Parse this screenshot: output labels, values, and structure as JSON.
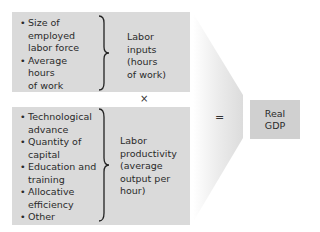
{
  "diagram": {
    "top_box": {
      "items": [
        "Size of employed labor force",
        "Average hours of work"
      ],
      "items_display": [
        [
          "Size of",
          "employed",
          "labor force"
        ],
        [
          "Average",
          "hours",
          "of work"
        ]
      ],
      "label_lines": [
        "Labor",
        "inputs",
        "(hours",
        "of work)"
      ]
    },
    "multiply_symbol": "×",
    "bottom_box": {
      "items": [
        "Technological advance",
        "Quantity of capital",
        "Education and training",
        "Allocative efficiency",
        "Other"
      ],
      "items_display": [
        [
          "Technological",
          "advance"
        ],
        [
          "Quantity of",
          "capital"
        ],
        [
          "Education and",
          "training"
        ],
        [
          "Allocative",
          "efficiency"
        ],
        [
          "Other"
        ]
      ],
      "label_lines": [
        "Labor",
        "productivity",
        "(average",
        "output per",
        "hour)"
      ]
    },
    "equals_symbol": "=",
    "result": {
      "lines": [
        "Real",
        "GDP"
      ]
    },
    "colors": {
      "box_fill": "#dadada",
      "result_fill": "#d0d0d0",
      "arrow_fill": "#e4e4e4",
      "text": "#2a2a2a"
    }
  }
}
